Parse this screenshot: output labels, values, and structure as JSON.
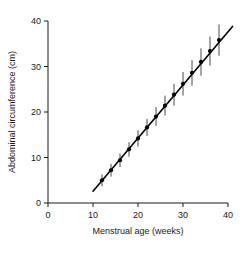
{
  "chart_data": {
    "type": "scatter",
    "title": "",
    "xlabel": "Menstrual age (weeks)",
    "ylabel": "Abdominal circumference (cm)",
    "xlim": [
      0,
      40
    ],
    "ylim": [
      0,
      40
    ],
    "xticks": [
      0,
      10,
      20,
      30,
      40
    ],
    "yticks": [
      0,
      10,
      20,
      30,
      40
    ],
    "xtick_labels": [
      "0",
      "10",
      "20",
      "30",
      "40"
    ],
    "ytick_labels": [
      "0",
      "10",
      "20",
      "30",
      "40"
    ],
    "grid": false,
    "legend": null,
    "series": [
      {
        "name": "Abdominal circumference (mean ± SD)",
        "marker": "filled-circle",
        "x": [
          12,
          14,
          16,
          18,
          20,
          22,
          24,
          26,
          28,
          30,
          32,
          34,
          36,
          38
        ],
        "values": [
          5.0,
          7.2,
          9.4,
          11.8,
          14.2,
          16.6,
          19.0,
          21.4,
          23.8,
          26.2,
          28.6,
          31.0,
          33.4,
          35.8
        ],
        "errors": [
          1.3,
          1.4,
          1.5,
          1.6,
          1.8,
          1.9,
          2.1,
          2.2,
          2.4,
          2.6,
          2.8,
          3.0,
          3.2,
          3.4
        ]
      }
    ],
    "fit_line": {
      "name": "linear regression",
      "x": [
        10,
        41
      ],
      "y": [
        2.6,
        38.8
      ]
    }
  }
}
